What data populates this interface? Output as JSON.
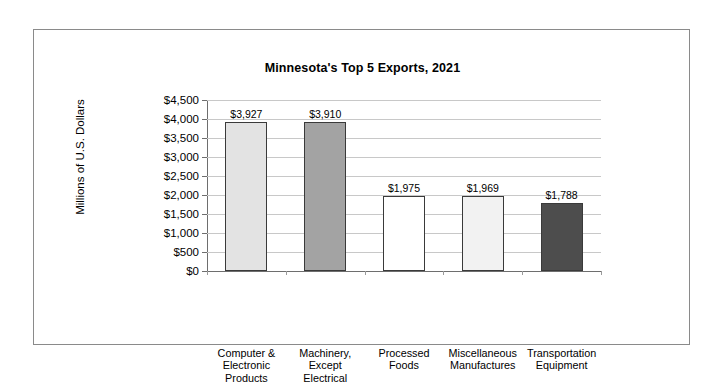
{
  "figure": {
    "border_color": "#8a8a8a",
    "background": "#ffffff"
  },
  "chart_data": {
    "type": "bar",
    "title": "Minnesota's Top 5 Exports, 2021",
    "xlabel": "",
    "ylabel": "Millions of U.S. Dollars",
    "categories": [
      "Computer &\nElectronic\nProducts",
      "Machinery,\nExcept\nElectrical",
      "Processed\nFoods",
      "Miscellaneous\nManufactures",
      "Transportation\nEquipment"
    ],
    "category_lines": [
      [
        "Computer &",
        "Electronic",
        "Products"
      ],
      [
        "Machinery,",
        "Except",
        "Electrical"
      ],
      [
        "Processed",
        "Foods"
      ],
      [
        "Miscellaneous",
        "Manufactures"
      ],
      [
        "Transportation",
        "Equipment"
      ]
    ],
    "values": [
      3927,
      3910,
      1975,
      1969,
      1788
    ],
    "value_labels": [
      "$3,927",
      "$3,910",
      "$1,975",
      "$1,969",
      "$1,788"
    ],
    "bar_colors": [
      "#e3e3e3",
      "#a3a3a3",
      "#ffffff",
      "#f2f2f2",
      "#4d4d4d"
    ],
    "bar_edge_color": "#3a3a3a",
    "ylim": [
      0,
      4500
    ],
    "ytick_values": [
      4500,
      4000,
      3500,
      3000,
      2500,
      2000,
      1500,
      1000,
      500,
      0
    ],
    "ytick_labels": [
      "$4,500",
      "$4,000",
      "$3,500",
      "$3,000",
      "$2,500",
      "$2,000",
      "$1,500",
      "$1,000",
      "$500",
      "$0"
    ],
    "grid": true,
    "grid_color": "#c8c8c8",
    "legend": null
  }
}
